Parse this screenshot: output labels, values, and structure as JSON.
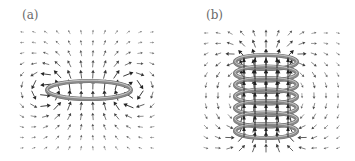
{
  "figure": {
    "panels": [
      {
        "id": "a",
        "label": "(a)",
        "description": "Magnetic field of a single current loop",
        "coil": {
          "type": "single-loop",
          "turns": 1
        }
      },
      {
        "id": "b",
        "label": "(b)",
        "description": "Magnetic field of a solenoid",
        "coil": {
          "type": "solenoid",
          "turns": 7
        }
      }
    ],
    "colors": {
      "background": "#ffffff",
      "ring": "#8a8a8a",
      "ring_highlight": "#c8c8c8",
      "arrow_strong": "#222222",
      "arrow_weak": "#b0b0b0",
      "label": "#6a6a6a"
    },
    "field_grid": {
      "columns": 12,
      "rows": 12
    }
  }
}
